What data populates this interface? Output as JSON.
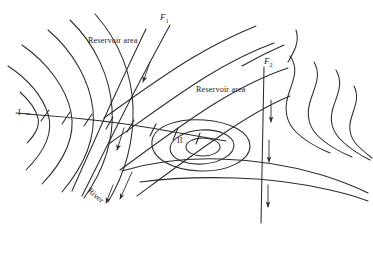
{
  "figure": {
    "type": "geological-structure-contour-map",
    "width": 373,
    "height": 253,
    "background_color": "#ffffff",
    "line_color": "#2b2b2b"
  },
  "labels": {
    "reservoir_area_1": "Reservoir area",
    "reservoir_area_2": "Reservoir area",
    "fault_1": "F",
    "fault_1_sub": "1",
    "fault_2": "F",
    "fault_2_sub": "2",
    "structure_1": "I",
    "structure_2": "II",
    "river": "River"
  },
  "annotations": {
    "fault_1_name": "F1",
    "fault_2_name": "F2",
    "structure_1_name": "I",
    "structure_2_name": "II",
    "slip_arrow_count_f1": 2,
    "down_arrow_count_f2": 3
  }
}
